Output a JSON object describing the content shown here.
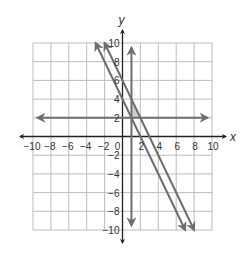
{
  "chart_data": {
    "type": "line",
    "title": "",
    "xlabel": "x",
    "ylabel": "y",
    "xlim": [
      -10,
      10
    ],
    "ylim": [
      -10,
      10
    ],
    "grid": true,
    "grid_step": 2,
    "x_ticks": [
      -10,
      -8,
      -6,
      -4,
      -2,
      0,
      2,
      4,
      6,
      8,
      10
    ],
    "y_ticks": [
      -10,
      -8,
      -6,
      -4,
      -2,
      2,
      4,
      6,
      8,
      10
    ],
    "origin_label": "0",
    "series": [
      {
        "name": "y = 2",
        "kind": "horizontal",
        "equation": "y = 2",
        "points": [
          [
            -9.5,
            2
          ],
          [
            9.5,
            2
          ]
        ],
        "arrows": "both"
      },
      {
        "name": "x = 1",
        "kind": "vertical",
        "equation": "x = 1",
        "points": [
          [
            1,
            9.5
          ],
          [
            1,
            -9.5
          ]
        ],
        "arrows": "both"
      },
      {
        "name": "y = -2x + 4",
        "kind": "line",
        "equation": "y = -2x + 4",
        "slope": -2,
        "intercept": 4,
        "points": [
          [
            -3,
            10
          ],
          [
            7,
            -10
          ]
        ],
        "arrows": "both"
      },
      {
        "name": "y = -2x + 6",
        "kind": "line",
        "equation": "y = -2x + 6",
        "slope": -2,
        "intercept": 6,
        "points": [
          [
            -2,
            10
          ],
          [
            8,
            -10
          ]
        ],
        "arrows": "both"
      }
    ],
    "shaded_region": {
      "vertices": [
        [
          1,
          2
        ],
        [
          2,
          2
        ],
        [
          1,
          4
        ]
      ]
    },
    "colors": {
      "grid": "#bdbdbd",
      "lines": "#6e6e6e",
      "axes": "#222222",
      "shade": "#cfcfcf"
    }
  }
}
